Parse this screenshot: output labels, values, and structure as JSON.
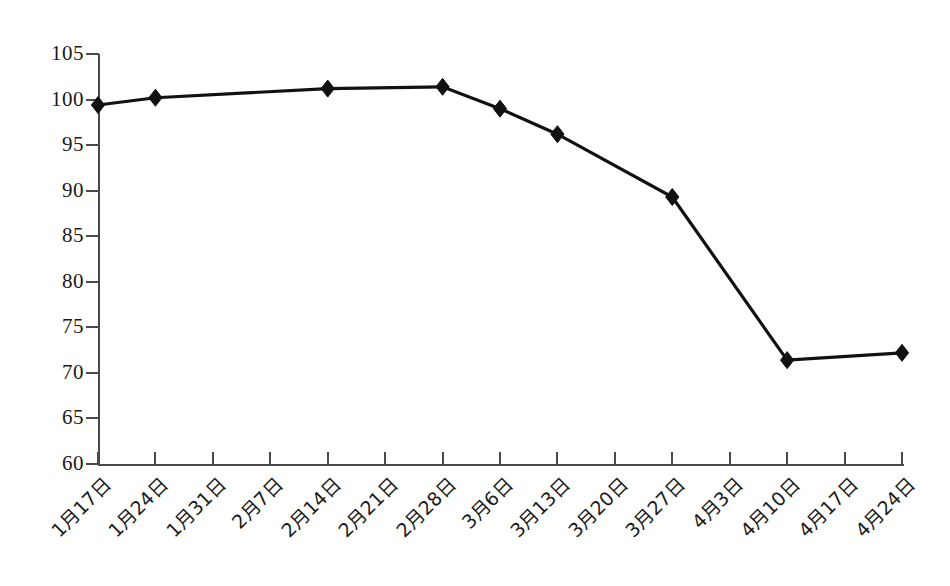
{
  "chart_data": {
    "type": "line",
    "title": "",
    "subtitle": "",
    "xlabel": "",
    "ylabel": "",
    "categories": [
      "1月17日",
      "1月24日",
      "1月31日",
      "2月7日",
      "2月14日",
      "2月21日",
      "2月28日",
      "3月6日",
      "3月13日",
      "3月20日",
      "3月27日",
      "4月3日",
      "4月10日",
      "4月17日",
      "4月24日"
    ],
    "series": [
      {
        "name": "",
        "points": [
          {
            "category": "1月17日",
            "category_index": 0,
            "value": 99.4,
            "marker": true
          },
          {
            "category": "1月24日",
            "category_index": 1,
            "value": 100.2,
            "marker": true
          },
          {
            "category": "2月14日",
            "category_index": 4,
            "value": 101.2,
            "marker": true
          },
          {
            "category": "2月28日",
            "category_index": 6,
            "value": 101.4,
            "marker": true
          },
          {
            "category": "3月6日",
            "category_index": 7,
            "value": 99.0,
            "marker": true
          },
          {
            "category": "3月13日",
            "category_index": 8,
            "value": 96.2,
            "marker": true
          },
          {
            "category": "3月27日",
            "category_index": 10,
            "value": 89.3,
            "marker": true
          },
          {
            "category": "4月10日",
            "category_index": 12,
            "value": 71.4,
            "marker": true
          },
          {
            "category": "4月24日",
            "category_index": 14,
            "value": 72.2,
            "marker": true
          }
        ]
      }
    ],
    "ytick_labels": [
      "105",
      "100",
      "95",
      "90",
      "85",
      "80",
      "75",
      "70",
      "65",
      "60"
    ],
    "ytick_values": [
      105,
      100,
      95,
      90,
      85,
      80,
      75,
      70,
      65,
      60
    ],
    "ylim": [
      60,
      105
    ],
    "ytick_step": 5,
    "xlim_index": [
      0,
      14
    ],
    "grid": false,
    "legend": false,
    "legend_position": "none",
    "marker_shape": "diamond",
    "line_color": "#111111",
    "marker_color": "#111111",
    "axis_color": "#4a4a4a",
    "background_color": "#ffffff",
    "xtick_label_rotation_deg": -45
  }
}
